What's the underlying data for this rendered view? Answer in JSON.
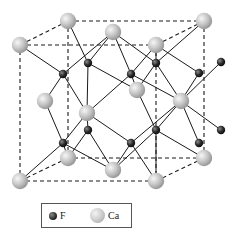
{
  "diagram": {
    "colors": {
      "ca": "#c8c8c8",
      "f": "#2f2f2f",
      "bond": "#1a1a1a",
      "cell_edge": "#1a1a1a"
    },
    "cell_corners": {
      "back": [
        [
          68,
          21
        ],
        [
          204,
          21
        ],
        [
          204,
          158
        ],
        [
          68,
          158
        ]
      ],
      "front": [
        [
          20,
          45
        ],
        [
          156,
          45
        ],
        [
          156,
          181
        ],
        [
          20,
          181
        ]
      ]
    },
    "ca_atoms": [
      [
        68,
        21
      ],
      [
        204,
        21
      ],
      [
        113,
        32
      ],
      [
        20,
        45
      ],
      [
        156,
        45
      ],
      [
        137,
        90
      ],
      [
        45,
        101
      ],
      [
        181,
        101
      ],
      [
        87,
        113
      ],
      [
        68,
        158
      ],
      [
        204,
        158
      ],
      [
        113,
        170
      ],
      [
        20,
        181
      ],
      [
        156,
        181
      ]
    ],
    "f_atoms": [
      [
        88,
        63
      ],
      [
        63,
        74
      ],
      [
        131,
        74
      ],
      [
        156,
        63
      ],
      [
        199,
        73
      ],
      [
        221,
        62
      ],
      [
        88,
        130
      ],
      [
        63,
        143
      ],
      [
        131,
        143
      ],
      [
        156,
        130
      ],
      [
        199,
        143
      ],
      [
        221,
        130
      ]
    ],
    "bonds": [
      [
        [
          68,
          21
        ],
        [
          88,
          63
        ]
      ],
      [
        [
          20,
          45
        ],
        [
          63,
          74
        ]
      ],
      [
        [
          113,
          32
        ],
        [
          88,
          63
        ]
      ],
      [
        [
          113,
          32
        ],
        [
          63,
          74
        ]
      ],
      [
        [
          113,
          32
        ],
        [
          131,
          74
        ]
      ],
      [
        [
          113,
          32
        ],
        [
          156,
          63
        ]
      ],
      [
        [
          156,
          45
        ],
        [
          131,
          74
        ]
      ],
      [
        [
          156,
          45
        ],
        [
          156,
          63
        ]
      ],
      [
        [
          204,
          21
        ],
        [
          156,
          63
        ]
      ],
      [
        [
          156,
          45
        ],
        [
          199,
          73
        ]
      ],
      [
        [
          45,
          101
        ],
        [
          63,
          74
        ]
      ],
      [
        [
          45,
          101
        ],
        [
          63,
          143
        ]
      ],
      [
        [
          87,
          113
        ],
        [
          63,
          74
        ]
      ],
      [
        [
          87,
          113
        ],
        [
          88,
          63
        ]
      ],
      [
        [
          87,
          113
        ],
        [
          131,
          74
        ]
      ],
      [
        [
          87,
          113
        ],
        [
          88,
          130
        ]
      ],
      [
        [
          87,
          113
        ],
        [
          63,
          143
        ]
      ],
      [
        [
          87,
          113
        ],
        [
          131,
          143
        ]
      ],
      [
        [
          137,
          90
        ],
        [
          88,
          63
        ]
      ],
      [
        [
          137,
          90
        ],
        [
          131,
          74
        ]
      ],
      [
        [
          137,
          90
        ],
        [
          156,
          130
        ]
      ],
      [
        [
          137,
          90
        ],
        [
          156,
          63
        ]
      ],
      [
        [
          181,
          101
        ],
        [
          131,
          74
        ]
      ],
      [
        [
          181,
          101
        ],
        [
          156,
          63
        ]
      ],
      [
        [
          181,
          101
        ],
        [
          199,
          73
        ]
      ],
      [
        [
          181,
          101
        ],
        [
          221,
          62
        ]
      ],
      [
        [
          181,
          101
        ],
        [
          156,
          130
        ]
      ],
      [
        [
          181,
          101
        ],
        [
          131,
          143
        ]
      ],
      [
        [
          181,
          101
        ],
        [
          199,
          143
        ]
      ],
      [
        [
          181,
          101
        ],
        [
          221,
          130
        ]
      ],
      [
        [
          68,
          158
        ],
        [
          88,
          130
        ]
      ],
      [
        [
          68,
          158
        ],
        [
          63,
          143
        ]
      ],
      [
        [
          20,
          181
        ],
        [
          63,
          143
        ]
      ],
      [
        [
          113,
          170
        ],
        [
          88,
          130
        ]
      ],
      [
        [
          113,
          170
        ],
        [
          63,
          143
        ]
      ],
      [
        [
          113,
          170
        ],
        [
          131,
          143
        ]
      ],
      [
        [
          113,
          170
        ],
        [
          156,
          130
        ]
      ],
      [
        [
          156,
          181
        ],
        [
          131,
          143
        ]
      ],
      [
        [
          204,
          158
        ],
        [
          156,
          130
        ]
      ],
      [
        [
          156,
          181
        ],
        [
          156,
          130
        ]
      ]
    ]
  },
  "legend": {
    "items": [
      {
        "symbol": "F",
        "label": "F"
      },
      {
        "symbol": "Ca",
        "label": "Ca"
      }
    ]
  }
}
